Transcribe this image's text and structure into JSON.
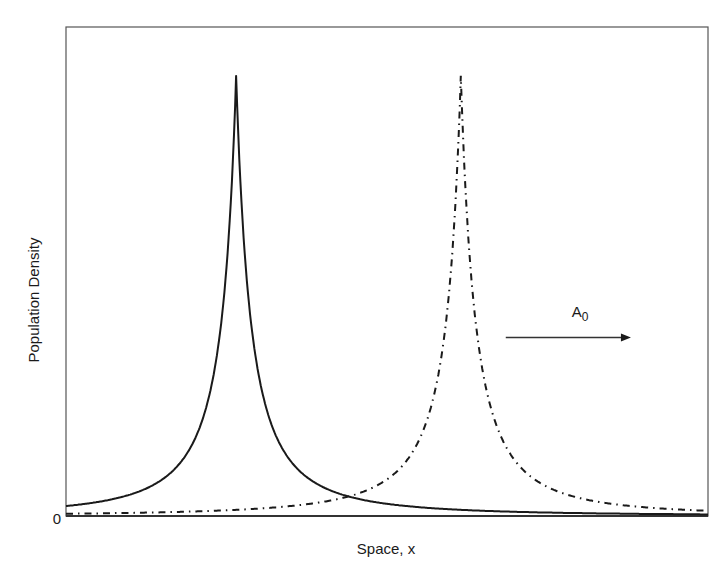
{
  "chart_data": {
    "type": "line",
    "title": "",
    "xlabel": "Space, x",
    "ylabel": "Population Density",
    "y_tick_labels": [
      "0"
    ],
    "x_tick_labels": [],
    "grid": false,
    "legend": null,
    "xlim": [
      0,
      1
    ],
    "ylim": [
      0,
      1
    ],
    "series": [
      {
        "name": "initial profile",
        "style": "solid",
        "color": "#1a1a1a",
        "peak_x": 0.265,
        "peak_y": 0.9,
        "half_width": 0.028,
        "x": [
          0.0,
          0.1,
          0.17,
          0.22,
          0.25,
          0.265,
          0.28,
          0.31,
          0.36,
          0.45,
          0.6,
          0.8,
          1.0
        ],
        "y": [
          0.02,
          0.05,
          0.11,
          0.3,
          0.68,
          0.9,
          0.68,
          0.3,
          0.11,
          0.04,
          0.015,
          0.007,
          0.004
        ]
      },
      {
        "name": "shifted profile",
        "style": "dash-dot",
        "color": "#1a1a1a",
        "peak_x": 0.615,
        "peak_y": 0.9,
        "half_width": 0.028,
        "x": [
          0.0,
          0.2,
          0.4,
          0.47,
          0.52,
          0.57,
          0.6,
          0.615,
          0.63,
          0.66,
          0.71,
          0.8,
          0.9,
          1.0
        ],
        "y": [
          0.003,
          0.007,
          0.025,
          0.05,
          0.11,
          0.3,
          0.68,
          0.9,
          0.68,
          0.3,
          0.11,
          0.04,
          0.02,
          0.01
        ]
      }
    ],
    "annotations": [
      {
        "type": "arrow",
        "from_x": 0.685,
        "to_x": 0.88,
        "y": 0.365,
        "direction": "right"
      },
      {
        "type": "text",
        "text": "A",
        "subscript": "0",
        "x": 0.8,
        "y": 0.415
      }
    ]
  },
  "labels": {
    "xlabel": "Space, x",
    "ylabel": "Population Density",
    "ytick_zero": "0",
    "annotation_main": "A",
    "annotation_sub": "0"
  },
  "colors": {
    "line": "#1a1a1a",
    "frame": "#555555",
    "background": "#ffffff"
  }
}
